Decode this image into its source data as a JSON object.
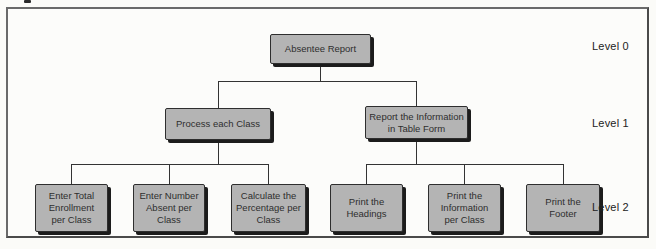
{
  "diagram": {
    "type": "hierarchy-chart",
    "levels": [
      {
        "label": "Level 0"
      },
      {
        "label": "Level 1"
      },
      {
        "label": "Level 2"
      }
    ],
    "nodes": {
      "root": {
        "label": "Absentee Report",
        "level": 0
      },
      "process_class": {
        "label": "Process each Class",
        "level": 1
      },
      "report_info": {
        "label": "Report the Information\nin Table Form",
        "level": 1
      },
      "enter_total": {
        "label": "Enter Total\nEnrollment\nper Class",
        "level": 2
      },
      "enter_number": {
        "label": "Enter Number\nAbsent per\nClass",
        "level": 2
      },
      "calc_percentage": {
        "label": "Calculate the\nPercentage per\nClass",
        "level": 2
      },
      "print_headings": {
        "label": "Print the\nHeadings",
        "level": 2
      },
      "print_information": {
        "label": "Print the\nInformation\nper Class",
        "level": 2
      },
      "print_footer": {
        "label": "Print the\nFooter",
        "level": 2
      }
    },
    "colors": {
      "box_fill": "#b4b4b4",
      "box_border": "#2e2e2e",
      "box_shadow": "#1c1c1c",
      "connector_line": "#333333",
      "text": "#2e2e2e",
      "frame_border": "#6a6a6a",
      "background": "#fbfbf8"
    }
  }
}
